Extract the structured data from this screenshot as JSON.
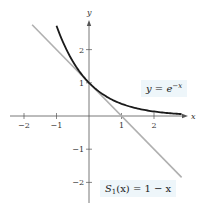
{
  "chart_data": {
    "type": "line",
    "title": "",
    "xlabel": "x",
    "ylabel": "y",
    "xlim": [
      -2.2,
      2.9
    ],
    "ylim": [
      -2.6,
      2.9
    ],
    "x_ticks": [
      -2,
      -1,
      1,
      2
    ],
    "y_ticks": [
      2,
      1,
      -1,
      -2
    ],
    "x_tick_labels": [
      "−2",
      "−1",
      "1",
      "2"
    ],
    "y_tick_labels": [
      "2",
      "1",
      "−1",
      "−2"
    ],
    "grid": false,
    "series": [
      {
        "name": "y = e^(−x)",
        "color": "#1a1a1a",
        "x": [
          -1.0,
          -0.75,
          -0.5,
          -0.25,
          0.0,
          0.25,
          0.5,
          0.75,
          1.0,
          1.5,
          2.0,
          2.5,
          2.85
        ],
        "values": [
          2.718,
          2.117,
          1.649,
          1.284,
          1.0,
          0.779,
          0.607,
          0.472,
          0.368,
          0.223,
          0.135,
          0.082,
          0.058
        ]
      },
      {
        "name": "S₁(x) = 1 − x",
        "color": "#b0b0b0",
        "x": [
          -1.75,
          2.85
        ],
        "values": [
          2.75,
          -1.85
        ]
      }
    ],
    "annotations": [
      {
        "text": "y = e^(−x)",
        "x": 2.0,
        "y": 1.0
      },
      {
        "text": "S₁(x) = 1 − x",
        "x": 1.3,
        "y": -2.1
      }
    ]
  },
  "labels": {
    "curve_label_prefix": "y = e",
    "curve_label_exp": "−x",
    "line_label_S": "S",
    "line_label_sub": "1",
    "line_label_rest": "(x) = 1 − x",
    "x_axis": "x",
    "y_axis": "y"
  }
}
